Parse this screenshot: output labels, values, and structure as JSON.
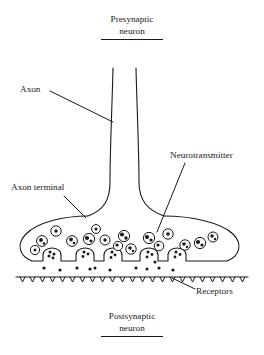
{
  "figure": {
    "kind": "synapse-diagram",
    "background_color": "#ffffff",
    "ink_color": "#1a1a1a",
    "width": 264,
    "height": 355
  },
  "titles": {
    "top_line1": "Presynaptic",
    "top_line2": "neuron",
    "bottom_line1": "Postsynaptic",
    "bottom_line2": "neuron"
  },
  "labels": {
    "axon": "Axon",
    "axon_terminal": "Axon terminal",
    "neurotransmitter": "Neurotransmitter",
    "receptors": "Receptors"
  },
  "parts": {
    "axon_tube": "axon-tube",
    "axon_terminal_bulb": "axon-terminal-bulb",
    "synaptic_vesicles": "synaptic-vesicles",
    "fusing_vesicles": "fusing-vesicles",
    "synaptic_cleft": "synaptic-cleft",
    "postsynaptic_membrane": "postsynaptic-membrane",
    "receptor_ticks": "receptor-ticks",
    "neurotransmitter_molecules": "neurotransmitter-molecules"
  },
  "counts": {
    "free_vesicles": 16,
    "fusing_vesicles": 5,
    "receptor_ticks": 23,
    "cleft_molecules": 11
  }
}
